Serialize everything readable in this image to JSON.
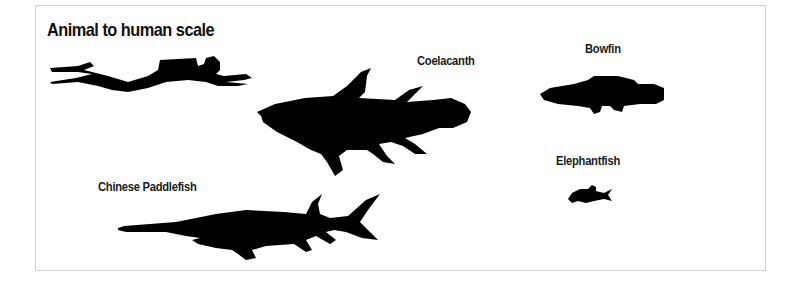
{
  "figure": {
    "title": "Animal to human scale",
    "silhouette_color": "#000000",
    "border_color": "#d2d2d2",
    "items": [
      {
        "id": "diver",
        "label": "",
        "icon": "scuba-diver-silhouette"
      },
      {
        "id": "coelacanth",
        "label": "Coelacanth",
        "icon": "coelacanth-silhouette"
      },
      {
        "id": "bowfin",
        "label": "Bowfin",
        "icon": "bowfin-silhouette"
      },
      {
        "id": "elephantfish",
        "label": "Elephantfish",
        "icon": "elephantfish-silhouette"
      },
      {
        "id": "chinese-paddlefish",
        "label": "Chinese Paddlefish",
        "icon": "chinese-paddlefish-silhouette"
      }
    ]
  }
}
